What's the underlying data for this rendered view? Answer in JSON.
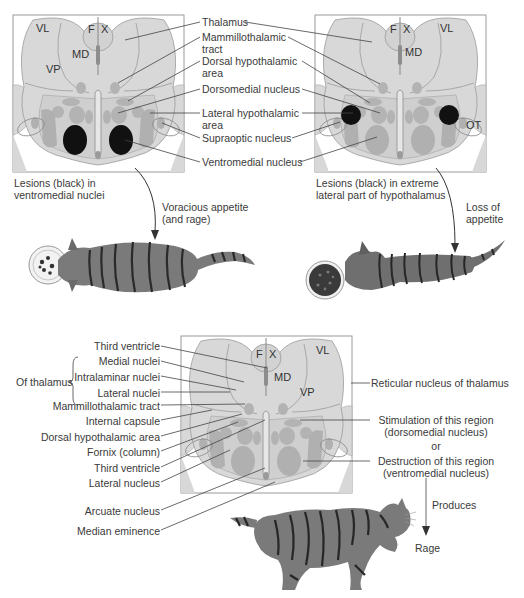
{
  "colors": {
    "tissue": "#d8d8d8",
    "tissue_dark": "#bdbdbd",
    "nucleus": "#a9a9a9",
    "lesion": "#111111",
    "outline": "#8a8a8a",
    "leader": "#444444",
    "cat_body": "#7a7a7a",
    "cat_stripe": "#2c2c2c"
  },
  "panel_top_left": {
    "region_labels": {
      "vl": "VL",
      "vp": "VP",
      "md": "MD",
      "f": "F",
      "x": "X"
    },
    "caption": [
      "Lesions (black) in",
      "ventromedial nuclei"
    ],
    "effect": [
      "Voracious appetite",
      "(and rage)"
    ]
  },
  "panel_top_right": {
    "region_labels": {
      "vl": "VL",
      "md": "MD",
      "f": "F",
      "x": "X",
      "ot": "OT"
    },
    "caption": [
      "Lesions (black) in extreme",
      "lateral part of hypothalamus"
    ],
    "effect": [
      "Loss of",
      "appetite"
    ]
  },
  "shared_labels": [
    [
      "Thalamus"
    ],
    [
      "Mammillothalamic",
      "tract"
    ],
    [
      "Dorsal hypothalamic",
      "area"
    ],
    [
      "Dorsomedial nucleus"
    ],
    [
      "Lateral hypothalamic",
      "area"
    ],
    [
      "Supraoptic nucleus"
    ],
    [
      "Ventromedial nucleus"
    ]
  ],
  "panel_bottom": {
    "region_labels": {
      "vl": "VL",
      "vp": "VP",
      "md": "MD",
      "f": "F",
      "x": "X"
    },
    "left_labels": [
      "Third ventricle",
      "Medial nuclei",
      "Intralaminar nuclei",
      "Lateral nuclei",
      "Mammillothalamic tract",
      "Internal capsule",
      "Dorsal hypothalamic area",
      "Fornix (column)",
      "Third ventricle",
      "Lateral nucleus",
      "Arcuate nucleus",
      "Median eminence"
    ],
    "group_label": "Of thalamus",
    "right_labels": {
      "reticular": "Reticular nucleus of thalamus",
      "stim1": "Stimulation of this region",
      "stim2": "(dorsomedial nucleus)",
      "or": "or",
      "dest1": "Destruction of this region",
      "dest2": "(ventromedial nucleus)",
      "produces": "Produces",
      "rage": "Rage"
    }
  }
}
